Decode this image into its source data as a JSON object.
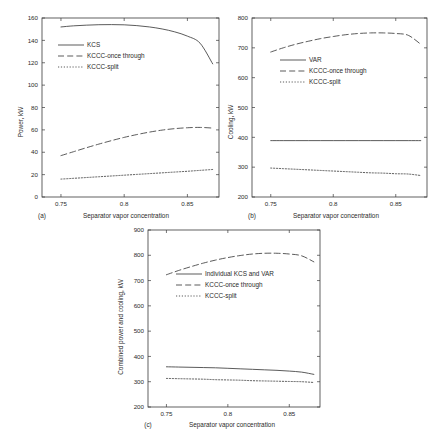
{
  "figure": {
    "xlabel": "Separator vapor concentration",
    "xticks": [
      "0.75",
      "0.8",
      "0.85"
    ],
    "xtick_values": [
      0.75,
      0.8,
      0.85
    ],
    "xlim": [
      0.735,
      0.875
    ]
  },
  "chart_data": [
    {
      "type": "line",
      "panel": "a",
      "caption": "(a)",
      "title": "",
      "xlabel": "Separator vapor concentration",
      "ylabel": "Power, kW",
      "xlim": [
        0.735,
        0.875
      ],
      "ylim": [
        0,
        160
      ],
      "yticks": [
        0,
        20,
        40,
        60,
        80,
        100,
        120,
        140,
        160
      ],
      "ytick_labels": [
        "0",
        "20",
        "40",
        "60",
        "80",
        "100",
        "120",
        "140",
        "160"
      ],
      "xticks": [
        0.75,
        0.8,
        0.85
      ],
      "xtick_labels": [
        "0.75",
        "0.8",
        "0.85"
      ],
      "grid": false,
      "legend_position": "upper-left-inside",
      "x": [
        0.75,
        0.76,
        0.77,
        0.78,
        0.79,
        0.8,
        0.81,
        0.82,
        0.83,
        0.84,
        0.85,
        0.86,
        0.87
      ],
      "series": [
        {
          "name": "KCS",
          "style": "solid",
          "values": [
            152.0,
            153.0,
            153.6,
            154.0,
            154.1,
            153.9,
            153.2,
            152.0,
            150.2,
            147.6,
            143.8,
            137.5,
            119.0
          ]
        },
        {
          "name": "KCCC-once through",
          "style": "dashed",
          "values": [
            37.0,
            40.5,
            44.0,
            47.3,
            50.4,
            53.3,
            55.8,
            58.0,
            59.8,
            61.1,
            61.9,
            62.2,
            61.6
          ]
        },
        {
          "name": "KCCC-split",
          "style": "dotted",
          "values": [
            16.0,
            16.7,
            17.4,
            18.1,
            18.8,
            19.5,
            20.2,
            20.9,
            21.6,
            22.3,
            23.0,
            23.8,
            24.6
          ]
        }
      ]
    },
    {
      "type": "line",
      "panel": "b",
      "caption": "(b)",
      "title": "",
      "xlabel": "Separator vapor concentration",
      "ylabel": "Cooling, kW",
      "xlim": [
        0.735,
        0.875
      ],
      "ylim": [
        200,
        800
      ],
      "yticks": [
        200,
        300,
        400,
        500,
        600,
        700,
        800
      ],
      "ytick_labels": [
        "200",
        "300",
        "400",
        "500",
        "600",
        "700",
        "800"
      ],
      "xticks": [
        0.75,
        0.8,
        0.85
      ],
      "xtick_labels": [
        "0.75",
        "0.8",
        "0.85"
      ],
      "grid": false,
      "legend_position": "upper-center-inside",
      "x": [
        0.75,
        0.76,
        0.77,
        0.78,
        0.79,
        0.8,
        0.81,
        0.82,
        0.83,
        0.84,
        0.85,
        0.86,
        0.87
      ],
      "series": [
        {
          "name": "VAR",
          "style": "solid",
          "values": [
            389,
            389,
            389,
            389,
            389,
            389,
            389,
            389,
            389,
            389,
            389,
            389,
            389
          ]
        },
        {
          "name": "KCCC-once through",
          "style": "dashed",
          "values": [
            686,
            700,
            712,
            722,
            731,
            738,
            744,
            748,
            750,
            750,
            748,
            742,
            712
          ]
        },
        {
          "name": "KCCC-split",
          "style": "dotted",
          "values": [
            297,
            295,
            293,
            291,
            289,
            287,
            285,
            283,
            281,
            280,
            278,
            277,
            272
          ]
        }
      ]
    },
    {
      "type": "line",
      "panel": "c",
      "caption": "(c)",
      "title": "",
      "xlabel": "Separator vapor concentration",
      "ylabel": "Combined power and cooling, kW",
      "xlim": [
        0.735,
        0.875
      ],
      "ylim": [
        200,
        900
      ],
      "yticks": [
        200,
        300,
        400,
        500,
        600,
        700,
        800,
        900
      ],
      "ytick_labels": [
        "200",
        "300",
        "400",
        "500",
        "600",
        "700",
        "800",
        "900"
      ],
      "xticks": [
        0.75,
        0.8,
        0.85
      ],
      "xtick_labels": [
        "0.75",
        "0.8",
        "0.85"
      ],
      "grid": false,
      "legend_position": "upper-center-inside",
      "x": [
        0.75,
        0.76,
        0.77,
        0.78,
        0.79,
        0.8,
        0.81,
        0.82,
        0.83,
        0.84,
        0.85,
        0.86,
        0.87
      ],
      "series": [
        {
          "name": "Individual KCS and VAR",
          "style": "solid",
          "values": [
            359,
            358,
            357,
            356,
            355,
            353,
            351,
            349,
            347,
            345,
            342,
            338,
            329
          ]
        },
        {
          "name": "KCCC-once through",
          "style": "dashed",
          "values": [
            723,
            740,
            755,
            769,
            781,
            791,
            799,
            805,
            808,
            808,
            805,
            798,
            774
          ]
        },
        {
          "name": "KCCC-split",
          "style": "dotted",
          "values": [
            313,
            312,
            311,
            310,
            308,
            307,
            306,
            304,
            303,
            302,
            301,
            300,
            297
          ]
        }
      ]
    }
  ]
}
